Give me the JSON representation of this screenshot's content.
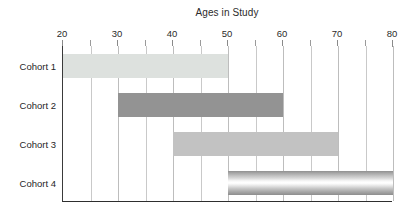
{
  "chart_data": {
    "type": "bar",
    "orientation": "horizontal",
    "subtype": "range-bar",
    "title": "Ages in Study",
    "xlabel": "",
    "ylabel": "",
    "xlim": [
      20,
      80
    ],
    "categories": [
      "Cohort 1",
      "Cohort 2",
      "Cohort 3",
      "Cohort 4"
    ],
    "tick_labels": [
      "20",
      "30",
      "40",
      "50",
      "60",
      "70",
      "80"
    ],
    "tick_values": [
      20,
      30,
      40,
      50,
      60,
      70,
      80
    ],
    "minor_tick_step": 5,
    "grid": true,
    "grid_axis": "x",
    "legend": false,
    "axis_position": "top",
    "bars": [
      {
        "category": "Cohort 1",
        "start": 20,
        "end": 50,
        "span": 30,
        "fill": "#dde1de",
        "style": "flat"
      },
      {
        "category": "Cohort 2",
        "start": 30,
        "end": 60,
        "span": 30,
        "fill": "#939393",
        "style": "flat"
      },
      {
        "category": "Cohort 3",
        "start": 40,
        "end": 70,
        "span": 30,
        "fill": "#c2c2c2",
        "style": "flat"
      },
      {
        "category": "Cohort 4",
        "start": 50,
        "end": 80,
        "span": 30,
        "fill": "#9a9a9a",
        "style": "cylinder-gradient"
      }
    ],
    "colors": {
      "cohort_1": "#dde1de",
      "cohort_2": "#939393",
      "cohort_3": "#c2c2c2",
      "cohort_4": "#9a9a9a",
      "gridline": "#c9c9c9",
      "axis_line": "#2e2e2e",
      "text": "#1f1f1f",
      "background": "#ffffff"
    }
  }
}
